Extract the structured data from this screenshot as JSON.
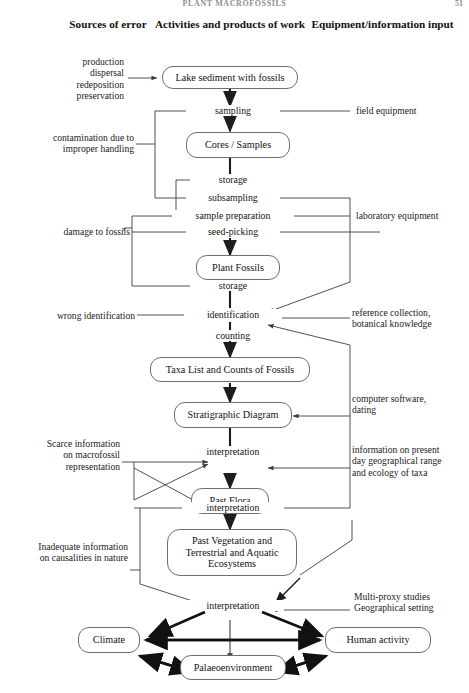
{
  "page": {
    "running_head": "PLANT MACROFOSSILS",
    "page_number": "51"
  },
  "columns": {
    "left": "Sources of error",
    "center": "Activities and products of work",
    "right": "Equipment/information input"
  },
  "nodes": {
    "lake_sediment": "Lake sediment with fossils",
    "cores_samples": "Cores / Samples",
    "plant_fossils": "Plant Fossils",
    "taxa_list": "Taxa List and Counts of Fossils",
    "strat_diagram": "Stratigraphic Diagram",
    "past_flora": "Past Flora",
    "past_vegetation": "Past Vegetation and Terrestrial and Aquatic Ecosystems",
    "climate": "Climate",
    "human_activity": "Human activity",
    "palaeoenvironment": "Palaeoenvironment"
  },
  "steps": {
    "sampling": "sampling",
    "storage_1": "storage",
    "subsampling": "subsampling",
    "sample_preparation": "sample preparation",
    "seed_picking": "seed-picking",
    "storage_2": "storage",
    "identification": "identification",
    "counting": "counting",
    "interpretation_1": "interpretation",
    "interpretation_2": "interpretation",
    "interpretation_3": "interpretation"
  },
  "sources_of_error": {
    "e1": "production dispersal redeposition preservation",
    "e1_lines": [
      "production",
      "dispersal",
      "redeposition",
      "preservation"
    ],
    "e2_lines": [
      "contamination due to",
      "improper handling"
    ],
    "e3": "damage to fossils",
    "e4": "wrong identification",
    "e5_lines": [
      "Scarce information",
      "on macrofossil",
      "representation"
    ],
    "e6_lines": [
      "Inadequate information",
      "on causalities in nature"
    ]
  },
  "inputs": {
    "i1": "field equipment",
    "i2": "laboratory equipment",
    "i3_lines": [
      "reference collection,",
      "botanical knowledge"
    ],
    "i4_lines": [
      "computer software,",
      "dating"
    ],
    "i5_lines": [
      "information on present",
      "day geographical range",
      "and ecology of taxa"
    ],
    "i6_lines": [
      "Multi-proxy studies",
      "Geographical setting"
    ]
  },
  "style": {
    "line_color": "#3d3d3d",
    "box_border": "#6f6f6f",
    "text_color": "#1b1b1b",
    "background": "#ffffff"
  }
}
